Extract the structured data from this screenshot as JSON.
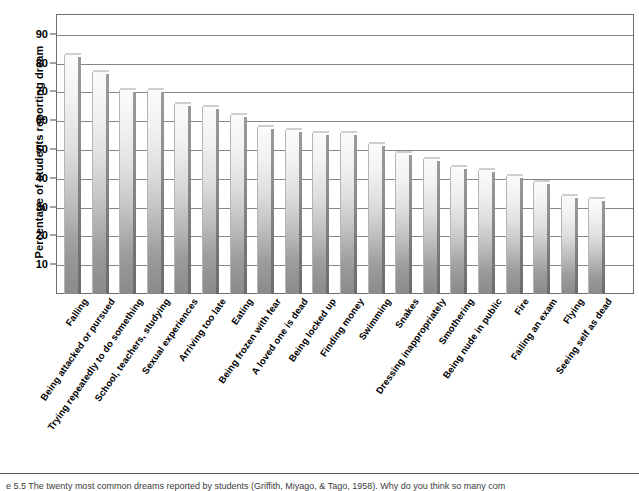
{
  "chart_data": {
    "type": "bar",
    "title": "",
    "xlabel": "",
    "ylabel": "Percentage of students reporting dream",
    "ylim": [
      0,
      95
    ],
    "grid": true,
    "legend": "none",
    "ytick_labels": [
      "90",
      "80",
      "70",
      "60",
      "50",
      "40",
      "30",
      "20",
      "10"
    ],
    "ytick_values": [
      90,
      80,
      70,
      60,
      50,
      40,
      30,
      20,
      10
    ],
    "categories": [
      "Falling",
      "Being attacked or pursued",
      "Trying repeatedly to do something",
      "School, teachers, studying",
      "Sexual experiences",
      "Arriving too late",
      "Eating",
      "Being frozen with fear",
      "A loved one is dead",
      "Being locked up",
      "Finding money",
      "Swimming",
      "Snakes",
      "Dressing inappropriately",
      "Smothering",
      "Being nude in public",
      "Fire",
      "Failing an exam",
      "Flying",
      "Seeing self as dead"
    ],
    "values": [
      83,
      77,
      71,
      71,
      66,
      65,
      62,
      58,
      57,
      56,
      56,
      52,
      49,
      47,
      44,
      43,
      41,
      39,
      34,
      33
    ]
  },
  "caption": {
    "text": "e 5.5  The twenty most common dreams reported by students (Griffith, Miyago, & Tago, 1958). Why do you think so many com"
  },
  "axis": {
    "y_title": "Percentage of students reporting dream"
  }
}
